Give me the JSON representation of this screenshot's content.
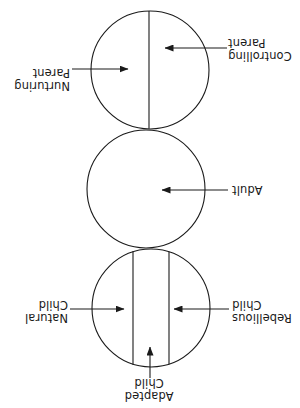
{
  "diagram": {
    "orientation_degrees": 180,
    "stroke_color": "#1a1a1a",
    "background_color": "#ffffff",
    "circles": [
      {
        "id": "child",
        "name": "Child",
        "cx": 149,
        "cy": 100,
        "r": 59,
        "dividers": 2
      },
      {
        "id": "adult",
        "name": "Adult",
        "cx": 154,
        "cy": 219,
        "r": 59,
        "dividers": 0
      },
      {
        "id": "parent",
        "name": "Parent",
        "cx": 150,
        "cy": 338,
        "r": 59,
        "dividers": 1
      }
    ],
    "labels": [
      {
        "id": "adapted-child",
        "line1": "Adapted",
        "line2": "Child",
        "text": "Adapted\nChild",
        "align": "center",
        "x": 118,
        "y": 6,
        "width": 66
      },
      {
        "id": "rebellious-child",
        "line1": "Rebellious",
        "line2": "Child",
        "text": "Rebellious\nChild",
        "align": "right",
        "x": 2,
        "y": 84,
        "width": 66
      },
      {
        "id": "natural-child",
        "line1": "Natural",
        "line2": "Child",
        "text": "Natural\nChild",
        "align": "left",
        "x": 232,
        "y": 84,
        "width": 66
      },
      {
        "id": "adult",
        "line1": "Adult",
        "line2": "",
        "text": "Adult",
        "align": "right",
        "x": 10,
        "y": 212,
        "width": 58
      },
      {
        "id": "controlling-parent",
        "line1": "Controlling",
        "line2": "Parent",
        "text": "Controlling\nParent",
        "align": "right",
        "x": 2,
        "y": 346,
        "width": 70
      },
      {
        "id": "nurturing-parent",
        "line1": "Nurturing",
        "line2": "Parent",
        "text": "Nurturing\nParent",
        "align": "left",
        "x": 230,
        "y": 316,
        "width": 68
      }
    ],
    "arrows": [
      {
        "id": "adapted-child-arrow",
        "from_x": 150,
        "from_y": 30,
        "to_x": 150,
        "to_y": 61,
        "direction": "down"
      },
      {
        "id": "rebellious-child-arrow",
        "from_x": 71,
        "from_y": 99,
        "to_x": 126,
        "to_y": 99,
        "direction": "right"
      },
      {
        "id": "natural-child-arrow",
        "from_x": 230,
        "from_y": 99,
        "to_x": 176,
        "to_y": 99,
        "direction": "left"
      },
      {
        "id": "adult-arrow",
        "from_x": 72,
        "from_y": 218,
        "to_x": 138,
        "to_y": 218,
        "direction": "right"
      },
      {
        "id": "controlling-parent-arrow",
        "from_x": 73,
        "from_y": 360,
        "to_x": 135,
        "to_y": 360,
        "direction": "right"
      },
      {
        "id": "nurturing-parent-arrow",
        "from_x": 228,
        "from_y": 339,
        "to_x": 172,
        "to_y": 339,
        "direction": "left"
      }
    ]
  }
}
